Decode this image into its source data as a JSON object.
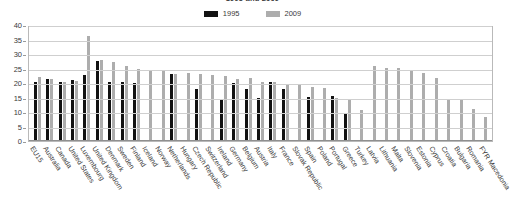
{
  "chart_data": {
    "type": "bar",
    "title": "1995 and 2009",
    "xlabel": "",
    "ylabel": "",
    "ylim": [
      0,
      40
    ],
    "yticks": [
      0,
      5,
      10,
      15,
      20,
      25,
      30,
      35,
      40
    ],
    "grid": true,
    "legend_position": "top-center",
    "colors": {
      "1995": "#121212",
      "2009": "#adadad"
    },
    "categories": [
      "EU15",
      "Australia",
      "Canada",
      "United States",
      "Luxembourg",
      "United Kingdom",
      "Denmark",
      "Sweden",
      "Finland",
      "Iceland",
      "Norway",
      "Netherlands",
      "Hungary",
      "Czech Republic",
      "Switzerland",
      "Ireland",
      "Germany",
      "Belgium",
      "Austria",
      "Italy",
      "France",
      "Slovak Republic",
      "Spain",
      "Poland",
      "Portugal",
      "Greece",
      "Turkey",
      "Latvia",
      "Lithuania",
      "Malta",
      "Slovenia",
      "Estonia",
      "Cyprus",
      "Croatia",
      "Bulgaria",
      "Romania",
      "FYR Macedonia"
    ],
    "series": [
      {
        "name": "1995",
        "values": [
          20.3,
          21.5,
          20.2,
          21.0,
          22.6,
          27.6,
          20.2,
          20.2,
          19.9,
          null,
          null,
          23.0,
          null,
          18.1,
          null,
          14.4,
          20.0,
          18.1,
          14.8,
          20.3,
          18.0,
          null,
          15.3,
          null,
          15.6,
          9.6,
          null,
          null,
          null,
          null,
          null,
          null,
          null,
          null,
          null,
          null,
          null
        ]
      },
      {
        "name": "2009",
        "values": [
          22.1,
          21.4,
          20.5,
          20.8,
          36.2,
          27.8,
          27.4,
          25.9,
          24.8,
          24.5,
          24.1,
          23.2,
          23.5,
          23.2,
          22.8,
          22.3,
          21.5,
          21.6,
          20.2,
          20.3,
          19.4,
          19.3,
          18.5,
          18.3,
          14.7,
          14.0,
          10.6,
          26.0,
          25.2,
          25.1,
          24.2,
          23.5,
          21.6,
          14.5,
          14.4,
          11.2,
          8.4
        ]
      }
    ]
  },
  "legend": {
    "items": [
      {
        "label": "1995",
        "color": "#121212"
      },
      {
        "label": "2009",
        "color": "#adadad"
      }
    ]
  }
}
